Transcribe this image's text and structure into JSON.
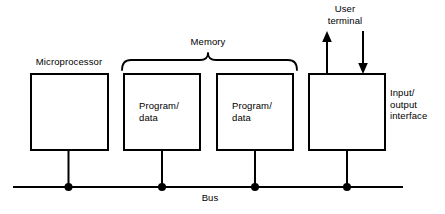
{
  "diagram": {
    "stroke_color": "#000000",
    "background_color": "#ffffff",
    "blocks": [
      {
        "id": "microprocessor",
        "label": "Microprocessor",
        "label_position": "above",
        "inner_text": ""
      },
      {
        "id": "memory-1",
        "label": "Program/\ndata",
        "label_position": "inside",
        "group": "Memory"
      },
      {
        "id": "memory-2",
        "label": "Program/\ndata",
        "label_position": "inside",
        "group": "Memory"
      },
      {
        "id": "io-interface",
        "label": "Input/\noutput\ninterface",
        "label_position": "right",
        "inner_text": ""
      }
    ],
    "group_brace": {
      "label": "Memory",
      "spans": [
        "memory-1",
        "memory-2"
      ]
    },
    "bus": {
      "label": "Bus",
      "connection_count": 4
    },
    "external_device": {
      "label": "User\nterminal",
      "arrows": [
        {
          "direction": "up",
          "name": "output-to-terminal"
        },
        {
          "direction": "down",
          "name": "input-from-terminal"
        }
      ]
    }
  }
}
